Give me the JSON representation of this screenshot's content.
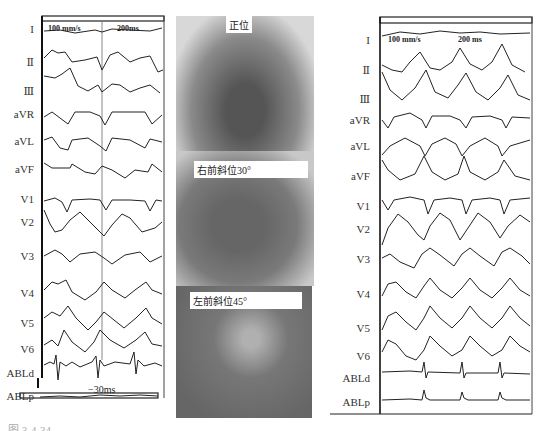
{
  "left_ecg": {
    "scale_speed": "100 mm/s",
    "scale_interval": "200ms",
    "leads": [
      "I",
      "Ⅱ",
      "Ⅲ",
      "aVR",
      "aVL",
      "aVF",
      "V1",
      "V2",
      "V3",
      "V4",
      "V5",
      "V6",
      "ABLd",
      "ABLp"
    ],
    "annotation": "−30ms"
  },
  "xray": {
    "views": [
      {
        "label": "正位"
      },
      {
        "label": "右前斜位30°"
      },
      {
        "label": "左前斜位45°"
      }
    ]
  },
  "right_ecg": {
    "scale_speed": "100 mm/s",
    "scale_interval": "200 ms",
    "leads": [
      "I",
      "Ⅱ",
      "Ⅲ",
      "aVR",
      "aVL",
      "aVF",
      "V1",
      "V2",
      "V3",
      "V4",
      "V5",
      "V6",
      "ABLd",
      "ABLp"
    ]
  },
  "caption": "图 3-4-34"
}
